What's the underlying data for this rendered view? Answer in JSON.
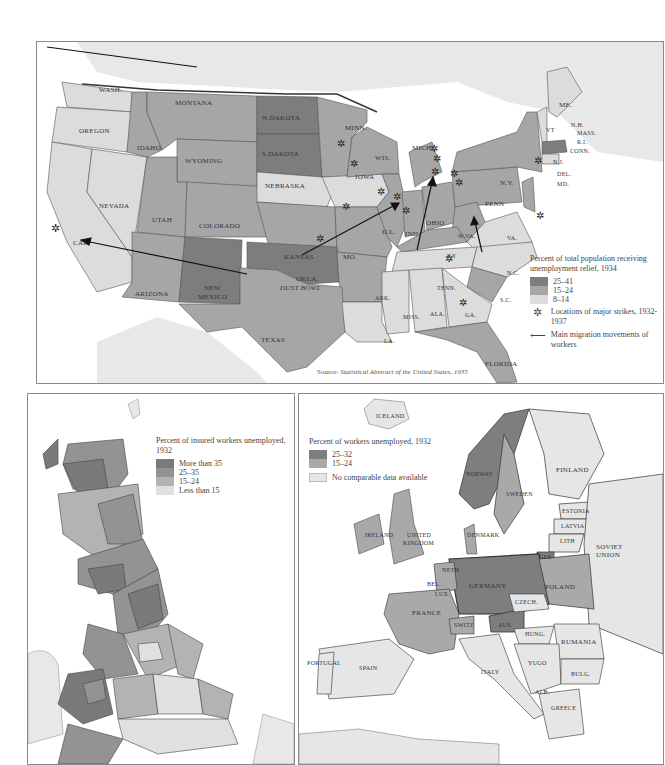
{
  "us_map": {
    "legend": {
      "title": "Percent of total population receiving unemployment relief, 1934",
      "classes": [
        {
          "label": "25–41",
          "color": "#7d7d7d"
        },
        {
          "label": "15–24",
          "color": "#a6a6a6"
        },
        {
          "label": "8–14",
          "color": "#dcdcdc"
        }
      ],
      "strike_label": "Locations of major strikes, 1932-1937",
      "migration_label": "Main migration movements of workers"
    },
    "source_prefix": "Source: ",
    "source_title": "Statistical Abstract of the United States, 1935",
    "states": [
      {
        "label": "WASH.",
        "x": 62,
        "y": 44
      },
      {
        "label": "OREGON",
        "x": 42,
        "y": 85
      },
      {
        "label": "MONTANA",
        "x": 138,
        "y": 57
      },
      {
        "label": "IDAHO",
        "x": 100,
        "y": 102
      },
      {
        "label": "WYOMING",
        "x": 148,
        "y": 115
      },
      {
        "label": "N.DAKOTA",
        "x": 225,
        "y": 89
      },
      {
        "label": "S.DAKOTA",
        "x": 225,
        "y": 125
      },
      {
        "label": "MINN.",
        "x": 308,
        "y": 99
      },
      {
        "label": "WIS.",
        "x": 353,
        "y": 121
      },
      {
        "label": "MICH.",
        "x": 390,
        "y": 125
      },
      {
        "label": "NEBRASKA",
        "x": 225,
        "y": 158
      },
      {
        "label": "IOWA",
        "x": 322,
        "y": 152
      },
      {
        "label": "NEVADA",
        "x": 66,
        "y": 148
      },
      {
        "label": "UTAH",
        "x": 118,
        "y": 156
      },
      {
        "label": "COLORADO",
        "x": 163,
        "y": 170
      },
      {
        "label": "CAL.",
        "x": 33,
        "y": 195
      },
      {
        "label": "KANSAS",
        "x": 237,
        "y": 210
      },
      {
        "label": "MO.",
        "x": 305,
        "y": 212
      },
      {
        "label": "ILL.",
        "x": 345,
        "y": 195
      },
      {
        "label": "IND.",
        "x": 376,
        "y": 197
      },
      {
        "label": "OHIO",
        "x": 400,
        "y": 182
      },
      {
        "label": "PENN",
        "x": 459,
        "y": 152
      },
      {
        "label": "N.Y.",
        "x": 474,
        "y": 124
      },
      {
        "label": "ME.",
        "x": 528,
        "y": 83
      },
      {
        "label": "VT",
        "x": 508,
        "y": 112
      },
      {
        "label": "N.H.",
        "x": 533,
        "y": 124
      },
      {
        "label": "MASS.",
        "x": 540,
        "y": 135
      },
      {
        "label": "R.I.",
        "x": 538,
        "y": 147
      },
      {
        "label": "CONN.",
        "x": 530,
        "y": 158
      },
      {
        "label": "N.J.",
        "x": 520,
        "y": 172
      },
      {
        "label": "DEL.",
        "x": 520,
        "y": 186
      },
      {
        "label": "MD.",
        "x": 520,
        "y": 196
      },
      {
        "label": "W.VA.",
        "x": 426,
        "y": 198
      },
      {
        "label": "VA.",
        "x": 462,
        "y": 212
      },
      {
        "label": "KY",
        "x": 408,
        "y": 220
      },
      {
        "label": "TENN.",
        "x": 394,
        "y": 244
      },
      {
        "label": "N.C.",
        "x": 464,
        "y": 232
      },
      {
        "label": "S.C.",
        "x": 463,
        "y": 256
      },
      {
        "label": "ARIZONA",
        "x": 100,
        "y": 251
      },
      {
        "label": "NEW",
        "x": 186,
        "y": 248
      },
      {
        "label": "MEXICO",
        "x": 182,
        "y": 258
      },
      {
        "label": "OKLA.",
        "x": 286,
        "y": 241
      },
      {
        "label": "ARK.",
        "x": 340,
        "y": 257
      },
      {
        "label": "MISS.",
        "x": 366,
        "y": 278
      },
      {
        "label": "ALA.",
        "x": 395,
        "y": 274
      },
      {
        "label": "GA.",
        "x": 432,
        "y": 274
      },
      {
        "label": "TEXAS",
        "x": 224,
        "y": 292
      },
      {
        "label": "LA.",
        "x": 347,
        "y": 298
      },
      {
        "label": "FLORIDA",
        "x": 455,
        "y": 315
      }
    ],
    "dust_bowl_label": "DUST BOWL"
  },
  "uk_map": {
    "legend": {
      "title": "Percent of insured workers unemployed, 1932",
      "classes": [
        {
          "label": "More than 35",
          "color": "#7a7a7a"
        },
        {
          "label": "25–35",
          "color": "#939393"
        },
        {
          "label": "15–24",
          "color": "#b3b3b3"
        },
        {
          "label": "Less than 15",
          "color": "#e0e0e0"
        }
      ]
    }
  },
  "europe_map": {
    "legend": {
      "title": "Percent of workers unemployed, 1932",
      "classes": [
        {
          "label": "25–32",
          "color": "#7e7e7e"
        },
        {
          "label": "15–24",
          "color": "#a9a9a9"
        }
      ],
      "no_data_label": "No comparable data available",
      "no_data_color": "#e6e6e6"
    },
    "countries": [
      {
        "label": "ICELAND",
        "x": 80,
        "y": 20
      },
      {
        "label": "NORWAY",
        "x": 172,
        "y": 78
      },
      {
        "label": "SWEDEN",
        "x": 210,
        "y": 101
      },
      {
        "label": "FINLAND",
        "x": 260,
        "y": 76
      },
      {
        "label": "ESTONIA",
        "x": 264,
        "y": 116
      },
      {
        "label": "LATVIA",
        "x": 260,
        "y": 137
      },
      {
        "label": "LITH",
        "x": 256,
        "y": 151
      },
      {
        "label": "GER",
        "x": 245,
        "y": 165
      },
      {
        "label": "SOVIET",
        "x": 296,
        "y": 151
      },
      {
        "label": "UNION",
        "x": 297,
        "y": 160
      },
      {
        "label": "DENMARK",
        "x": 168,
        "y": 136
      },
      {
        "label": "IRELAND",
        "x": 67,
        "y": 139
      },
      {
        "label": "UNITED",
        "x": 108,
        "y": 139
      },
      {
        "label": "KINGDOM",
        "x": 104,
        "y": 146
      },
      {
        "label": "NETH",
        "x": 143,
        "y": 176
      },
      {
        "label": "BEL.",
        "x": 129,
        "y": 189
      },
      {
        "label": "LUX.",
        "x": 137,
        "y": 202
      },
      {
        "label": "GERMANY",
        "x": 179,
        "y": 189
      },
      {
        "label": "POLAND",
        "x": 244,
        "y": 192
      },
      {
        "label": "CZECH.",
        "x": 217,
        "y": 209
      },
      {
        "label": "FRANCE",
        "x": 113,
        "y": 219
      },
      {
        "label": "SWITZ",
        "x": 155,
        "y": 232
      },
      {
        "label": "AUS.",
        "x": 201,
        "y": 231
      },
      {
        "label": "HUNG.",
        "x": 226,
        "y": 239
      },
      {
        "label": "RUMANIA",
        "x": 262,
        "y": 249
      },
      {
        "label": "PORTUGAL",
        "x": 6,
        "y": 269
      },
      {
        "label": "SPAIN",
        "x": 60,
        "y": 274
      },
      {
        "label": "ITALY",
        "x": 182,
        "y": 279
      },
      {
        "label": "YUGO",
        "x": 226,
        "y": 268
      },
      {
        "label": "BULG.",
        "x": 273,
        "y": 280
      },
      {
        "label": "ALB.",
        "x": 235,
        "y": 300
      },
      {
        "label": "GREECE",
        "x": 252,
        "y": 314
      }
    ]
  }
}
